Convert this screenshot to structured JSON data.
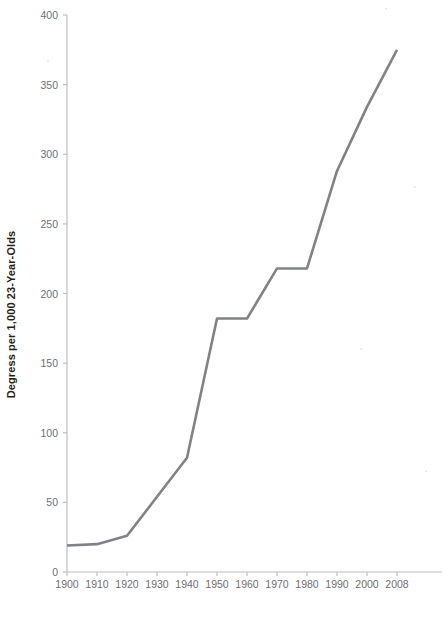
{
  "chart_data": {
    "type": "line",
    "title": "",
    "xlabel": "Year",
    "ylabel": "Degress per 1,000 23-Year-Olds",
    "x": [
      1900,
      1910,
      1920,
      1930,
      1940,
      1950,
      1960,
      1970,
      1980,
      1990,
      2000,
      2008
    ],
    "values": [
      19,
      20,
      26,
      54,
      82,
      182,
      182,
      218,
      218,
      288,
      334,
      375
    ],
    "series": [
      {
        "name": "Degrees per 1,000 23-Year-Olds",
        "values": [
          19,
          20,
          26,
          54,
          82,
          182,
          182,
          218,
          218,
          288,
          334,
          375
        ]
      }
    ],
    "xlim": [
      1900,
      2008
    ],
    "ylim": [
      0,
      400
    ],
    "y_ticks": [
      0,
      50,
      100,
      150,
      200,
      250,
      300,
      350,
      400
    ],
    "x_ticks": [
      1900,
      1910,
      1920,
      1930,
      1940,
      1950,
      1960,
      1970,
      1980,
      1990,
      2000,
      2008
    ],
    "x_tick_labels": [
      "1900",
      "1910",
      "1920",
      "1930",
      "1940",
      "1950",
      "1960",
      "1970",
      "1980",
      "1990",
      "2000",
      "2008"
    ],
    "y_tick_labels": [
      "0",
      "50",
      "100",
      "150",
      "200",
      "250",
      "300",
      "350",
      "400"
    ],
    "grid": false,
    "legend": "none",
    "line_color": "#808285",
    "axis_color": "#bcbec0",
    "tick_label_color": "#6d6e71",
    "title_color": "#231f20",
    "background": "#ffffff"
  },
  "axes": {
    "y_title": "Degress per 1,000 23-Year-Olds",
    "x_title": "Year"
  }
}
